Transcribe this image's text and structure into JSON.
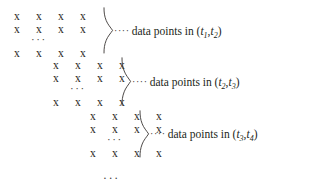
{
  "figure": {
    "mark_glyph": "x",
    "ellipsis": "···",
    "leader": "····",
    "tail_ellipsis": "···",
    "blocks": [
      {
        "id": "block-1",
        "rows": 3,
        "marks_per_row": 4,
        "row_ellipsis": "···",
        "left": 14,
        "top": 8,
        "annotation": {
          "leader": "····",
          "text": "data points in (",
          "var1": "t",
          "sub1": "1",
          "comma": ",",
          "var2": "t",
          "sub2": "2",
          "close": ")"
        }
      },
      {
        "id": "block-2",
        "rows": 3,
        "marks_per_row": 4,
        "row_ellipsis": "···",
        "left": 53,
        "top": 57,
        "annotation": {
          "leader": "····",
          "text": "data points in (",
          "var1": "t",
          "sub1": "2",
          "comma": ",",
          "var2": "t",
          "sub2": "3",
          "close": ")"
        }
      },
      {
        "id": "block-3",
        "rows": 3,
        "marks_per_row": 4,
        "row_ellipsis": "···",
        "left": 90,
        "top": 108,
        "annotation": {
          "leader": "····",
          "text": "data points in (",
          "var1": "t",
          "sub1": "3",
          "comma": ",",
          "var2": "t",
          "sub2": "4",
          "close": ")"
        }
      }
    ]
  }
}
